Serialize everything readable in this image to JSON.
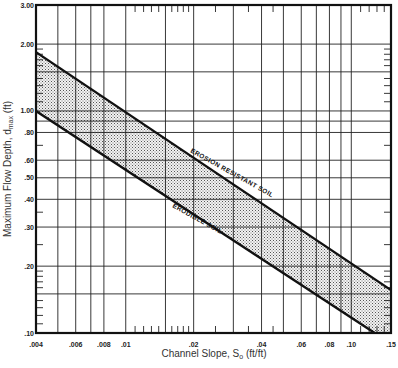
{
  "chart_data": {
    "type": "area",
    "title": "",
    "xlabel": "Channel Slope, S",
    "xlabel_sub": "o",
    "xlabel_unit": " (ft/ft)",
    "ylabel": "Maximum Flow Depth, d",
    "ylabel_sub": "max",
    "ylabel_unit": " (ft)",
    "xscale": "log",
    "yscale": "log",
    "xlim": [
      0.004,
      0.15
    ],
    "ylim": [
      0.1,
      3.0
    ],
    "grid": true,
    "x_tick_labels": [
      ".004",
      ".006",
      ".008",
      ".01",
      ".02",
      ".04",
      ".06",
      ".08",
      ".10",
      ".15"
    ],
    "x_tick_values": [
      0.004,
      0.006,
      0.008,
      0.01,
      0.02,
      0.04,
      0.06,
      0.08,
      0.1,
      0.15
    ],
    "x_gridlines": [
      0.005,
      0.006,
      0.007,
      0.008,
      0.01,
      0.015,
      0.02,
      0.03,
      0.04,
      0.05,
      0.06,
      0.07,
      0.08,
      0.09,
      0.1
    ],
    "y_tick_labels": [
      "3.00",
      "2.00",
      "1.00",
      ".80",
      ".60",
      ".50",
      ".40",
      ".30",
      ".20",
      ".10"
    ],
    "y_tick_values": [
      3.0,
      2.0,
      1.0,
      0.8,
      0.6,
      0.5,
      0.4,
      0.3,
      0.2,
      0.1
    ],
    "y_gridlines": [
      2.0,
      1.5,
      1.0,
      0.9,
      0.8,
      0.6,
      0.5,
      0.4,
      0.3,
      0.2,
      0.15
    ],
    "series": [
      {
        "name": "EROSION RESISTANT SOIL",
        "x": [
          0.004,
          0.15
        ],
        "y": [
          1.84,
          0.156
        ]
      },
      {
        "name": "ERODIBLE SOIL",
        "x": [
          0.004,
          0.127
        ],
        "y": [
          1.0,
          0.1
        ]
      }
    ],
    "shaded_region": "between ERODIBLE SOIL and EROSION RESISTANT SOIL lines (stippled)"
  }
}
